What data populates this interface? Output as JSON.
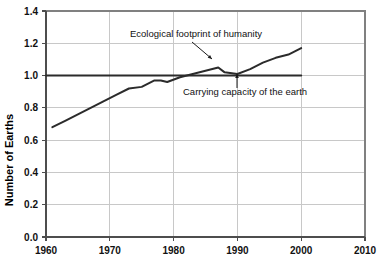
{
  "chart_data": {
    "type": "line",
    "title": "",
    "xlabel": "",
    "ylabel": "Number of Earths",
    "xlim": [
      1960,
      2010
    ],
    "ylim": [
      0.0,
      1.4
    ],
    "xticks": [
      1960,
      1970,
      1980,
      1990,
      2000,
      2010
    ],
    "xtick_labels": [
      "1960",
      "1970",
      "1980",
      "1990",
      "2000",
      "2010"
    ],
    "yticks": [
      0.0,
      0.2,
      0.4,
      0.6,
      0.8,
      1.0,
      1.2,
      1.4
    ],
    "ytick_labels": [
      "0.0",
      "0.2",
      "0.4",
      "0.6",
      "0.8",
      "1.0",
      "1.2",
      "1.4"
    ],
    "grid": true,
    "grid_color": "#c8c8c8",
    "legend": "none",
    "plot_border_color": "#808080",
    "background": "#ffffff",
    "series": [
      {
        "name": "Ecological footprint of humanity",
        "color": "#2b2b2b",
        "width": 2.0,
        "x": [
          1961,
          1963,
          1965,
          1967,
          1969,
          1971,
          1973,
          1975,
          1977,
          1978,
          1979,
          1981,
          1983,
          1985,
          1987,
          1988,
          1990,
          1992,
          1994,
          1996,
          1998,
          1999,
          2000
        ],
        "y": [
          0.68,
          0.72,
          0.76,
          0.8,
          0.84,
          0.88,
          0.92,
          0.93,
          0.97,
          0.97,
          0.96,
          0.99,
          1.01,
          1.03,
          1.05,
          1.02,
          1.01,
          1.04,
          1.08,
          1.11,
          1.13,
          1.15,
          1.17
        ]
      },
      {
        "name": "Carrying capacity of the earth",
        "color": "#2b2b2b",
        "width": 2.0,
        "x": [
          1960,
          2000
        ],
        "y": [
          1.0,
          1.0
        ]
      }
    ],
    "annotations": [
      {
        "name": "footprint-annotation",
        "text": "Ecological footprint of humanity",
        "text_x": 130,
        "text_y": 37,
        "leader": {
          "x1": 192,
          "y1": 42,
          "x2": 212,
          "y2": 59
        },
        "arrow_at": "end"
      },
      {
        "name": "carrying-capacity-annotation",
        "text": "Carrying capacity of the earth",
        "text_x": 183,
        "text_y": 95,
        "leader": {
          "x1": 237,
          "y1": 88,
          "x2": 237,
          "y2": 74
        },
        "arrow_at": "end"
      }
    ]
  },
  "axes": {
    "y_title": "Number of Earths",
    "y_labels": [
      "1.4",
      "1.2",
      "1.0",
      "0.8",
      "0.6",
      "0.4",
      "0.2",
      "0.0"
    ],
    "x_labels": [
      "1960",
      "1970",
      "1980",
      "1990",
      "2000",
      "2010"
    ]
  },
  "annotations": {
    "footprint": "Ecological footprint of humanity",
    "carrying_capacity": "Carrying capacity of the earth"
  }
}
